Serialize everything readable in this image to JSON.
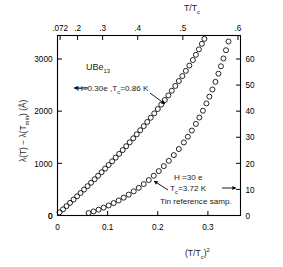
{
  "chart_data": {
    "type": "scatter",
    "title": "",
    "xlabel": "(T/Tc)^2",
    "ylabel": "lambda(T) - lambda(Tmin) (Angstrom)",
    "y2label": "",
    "xlim": [
      0,
      0.365
    ],
    "ylim": [
      0,
      3450
    ],
    "y2lim": [
      0,
      69
    ],
    "grid": false,
    "legend": "none",
    "axes": {
      "bottom": {
        "label": "(T/Tc)2",
        "label_main": "(T/T",
        "label_sub": "c",
        "label_tail": ")",
        "label_sup": "2",
        "ticks": [
          0,
          0.1,
          0.2,
          0.3
        ],
        "ticklabels": [
          "0",
          "0.1",
          "0.2",
          "0.3"
        ]
      },
      "top": {
        "label": "T/Tc",
        "label_main": "T/T",
        "label_sub": "c",
        "ticks": [
          0.072,
          0.2,
          0.3,
          0.4,
          0.5,
          0.6
        ],
        "ticklabels": [
          ".072",
          ".2",
          ".3",
          ".4",
          ".5",
          ".6"
        ]
      },
      "left": {
        "label_parts": [
          "λ(T) − λ(T",
          "min",
          ") (Å)"
        ],
        "ticks": [
          0,
          1000,
          2000,
          3000
        ],
        "ticklabels": [
          "0",
          "1000",
          "2000",
          "3000"
        ]
      },
      "right": {
        "ticks": [
          0,
          10,
          20,
          30,
          40,
          50,
          60
        ],
        "ticklabels": [
          "0",
          "10",
          "20",
          "30",
          "40",
          "50",
          "60"
        ]
      }
    },
    "annotations": {
      "sample_name": "UBe13",
      "sample_name_main": "UBe",
      "sample_name_sub": "13",
      "ube_condition": "H=0.30e ,Tc=0.86 K",
      "ube_cond_h": "H=0.30e ,T",
      "ube_cond_sub": "c",
      "ube_cond_tail": "=0.86 K",
      "tin_h": "H =30 e",
      "tin_tc_main": "T",
      "tin_tc_sub": "c",
      "tin_tc_tail": "=3.72 K",
      "tin_caption": "Tin reference samp."
    },
    "series": [
      {
        "name": "UBe13",
        "marker": "open-circle",
        "axis": "left",
        "points": [
          [
            0.004,
            60
          ],
          [
            0.011,
            118
          ],
          [
            0.018,
            180
          ],
          [
            0.025,
            242
          ],
          [
            0.032,
            305
          ],
          [
            0.039,
            368
          ],
          [
            0.046,
            432
          ],
          [
            0.053,
            497
          ],
          [
            0.06,
            562
          ],
          [
            0.067,
            628
          ],
          [
            0.074,
            695
          ],
          [
            0.081,
            762
          ],
          [
            0.088,
            830
          ],
          [
            0.095,
            899
          ],
          [
            0.102,
            968
          ],
          [
            0.109,
            1038
          ],
          [
            0.116,
            1109
          ],
          [
            0.123,
            1181
          ],
          [
            0.13,
            1254
          ],
          [
            0.137,
            1328
          ],
          [
            0.144,
            1403
          ],
          [
            0.151,
            1479
          ],
          [
            0.158,
            1556
          ],
          [
            0.165,
            1634
          ],
          [
            0.172,
            1713
          ],
          [
            0.179,
            1793
          ],
          [
            0.186,
            1874
          ],
          [
            0.193,
            1957
          ],
          [
            0.2,
            2041
          ],
          [
            0.207,
            2126
          ],
          [
            0.214,
            2213
          ],
          [
            0.221,
            2301
          ],
          [
            0.228,
            2391
          ],
          [
            0.235,
            2483
          ],
          [
            0.242,
            2577
          ],
          [
            0.249,
            2673
          ],
          [
            0.256,
            2772
          ],
          [
            0.263,
            2874
          ],
          [
            0.27,
            2980
          ],
          [
            0.276,
            3080
          ],
          [
            0.282,
            3185
          ],
          [
            0.288,
            3290
          ],
          [
            0.293,
            3385
          ]
        ]
      },
      {
        "name": "Tin reference samp.",
        "marker": "open-circle",
        "axis": "left",
        "points": [
          [
            0.062,
            48
          ],
          [
            0.072,
            78
          ],
          [
            0.082,
            112
          ],
          [
            0.092,
            150
          ],
          [
            0.102,
            192
          ],
          [
            0.112,
            238
          ],
          [
            0.122,
            288
          ],
          [
            0.132,
            342
          ],
          [
            0.142,
            400
          ],
          [
            0.152,
            463
          ],
          [
            0.162,
            530
          ],
          [
            0.172,
            602
          ],
          [
            0.182,
            679
          ],
          [
            0.192,
            762
          ],
          [
            0.202,
            851
          ],
          [
            0.212,
            946
          ],
          [
            0.222,
            1048
          ],
          [
            0.232,
            1157
          ],
          [
            0.242,
            1274
          ],
          [
            0.252,
            1400
          ],
          [
            0.26,
            1510
          ],
          [
            0.268,
            1628
          ],
          [
            0.276,
            1756
          ],
          [
            0.283,
            1878
          ],
          [
            0.29,
            2008
          ],
          [
            0.297,
            2148
          ],
          [
            0.303,
            2278
          ],
          [
            0.309,
            2415
          ],
          [
            0.315,
            2562
          ],
          [
            0.321,
            2718
          ],
          [
            0.326,
            2860
          ],
          [
            0.331,
            3010
          ],
          [
            0.336,
            3168
          ],
          [
            0.341,
            3335
          ]
        ]
      }
    ]
  }
}
